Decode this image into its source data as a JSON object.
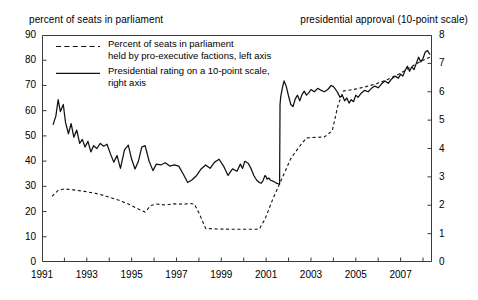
{
  "captions": {
    "left": "percent of seats in parliament",
    "right": "presidential approval (10-point scale)"
  },
  "legend": {
    "dashed": {
      "line1": "Percent of seats in parliament",
      "line2": "held by pro-executive factions, left axis",
      "swatch": "dashed-line-swatch"
    },
    "solid": {
      "line1": "Presidential rating on a 10-point scale,",
      "line2": "right axis",
      "swatch": "solid-line-swatch"
    }
  },
  "axes": {
    "left_ticks": [
      "90",
      "80",
      "70",
      "60",
      "50",
      "40",
      "30",
      "20",
      "10",
      "0"
    ],
    "right_ticks": [
      "8",
      "7",
      "6",
      "5",
      "4",
      "3",
      "2",
      "1",
      "0"
    ],
    "x_ticks": [
      "1991",
      "1993",
      "1995",
      "1997",
      "1999",
      "2001",
      "2003",
      "2005",
      "2007"
    ]
  },
  "chart_data": {
    "type": "line",
    "title": "",
    "xlabel": "",
    "ylabel": "percent of seats in parliament",
    "ylabel_right": "presidential approval (10-point scale)",
    "xlim": [
      1991,
      2008.4
    ],
    "ylim": [
      0,
      90
    ],
    "ylim_right": [
      0,
      8
    ],
    "grid": false,
    "legend_position": "upper-left-inside",
    "series": [
      {
        "name": "Percent of seats in parliament held by pro-executive factions, left axis",
        "style": "dashed",
        "axis": "left",
        "color": "#111111",
        "points": [
          [
            1991.45,
            26.0
          ],
          [
            1991.7,
            28.3
          ],
          [
            1992.0,
            29.0
          ],
          [
            1992.4,
            28.6
          ],
          [
            1992.9,
            28.0
          ],
          [
            1993.4,
            27.2
          ],
          [
            1993.9,
            26.0
          ],
          [
            1994.4,
            24.6
          ],
          [
            1994.9,
            22.8
          ],
          [
            1995.3,
            21.0
          ],
          [
            1995.6,
            19.8
          ],
          [
            1995.85,
            22.4
          ],
          [
            1996.1,
            23.0
          ],
          [
            1996.5,
            22.6
          ],
          [
            1996.9,
            23.1
          ],
          [
            1997.3,
            22.9
          ],
          [
            1997.6,
            23.2
          ],
          [
            1997.8,
            22.9
          ],
          [
            1998.0,
            19.5
          ],
          [
            1998.3,
            13.3
          ],
          [
            1998.8,
            13.1
          ],
          [
            1999.4,
            13.0
          ],
          [
            1999.9,
            13.0
          ],
          [
            2000.3,
            13.0
          ],
          [
            2000.55,
            13.0
          ],
          [
            2000.7,
            13.1
          ],
          [
            2000.95,
            17.0
          ],
          [
            2001.3,
            25.0
          ],
          [
            2001.7,
            33.0
          ],
          [
            2002.1,
            41.0
          ],
          [
            2002.5,
            46.0
          ],
          [
            2002.8,
            49.2
          ],
          [
            2003.2,
            49.4
          ],
          [
            2003.6,
            49.6
          ],
          [
            2003.95,
            52.0
          ],
          [
            2004.2,
            62.0
          ],
          [
            2004.45,
            67.8
          ],
          [
            2004.9,
            68.4
          ],
          [
            2005.4,
            69.4
          ],
          [
            2005.9,
            70.6
          ],
          [
            2006.4,
            72.3
          ],
          [
            2006.9,
            74.4
          ],
          [
            2007.4,
            77.0
          ],
          [
            2007.9,
            79.6
          ],
          [
            2008.3,
            81.2
          ]
        ]
      },
      {
        "name": "Presidential rating on a 10-point scale, right axis",
        "style": "solid",
        "axis": "right",
        "color": "#111111",
        "points": [
          [
            1991.5,
            4.85
          ],
          [
            1991.62,
            5.15
          ],
          [
            1991.72,
            5.72
          ],
          [
            1991.82,
            5.3
          ],
          [
            1991.95,
            5.55
          ],
          [
            1992.05,
            4.92
          ],
          [
            1992.18,
            4.52
          ],
          [
            1992.3,
            4.88
          ],
          [
            1992.42,
            4.4
          ],
          [
            1992.55,
            4.65
          ],
          [
            1992.68,
            4.18
          ],
          [
            1992.8,
            4.32
          ],
          [
            1992.92,
            4.05
          ],
          [
            1993.05,
            4.25
          ],
          [
            1993.18,
            3.88
          ],
          [
            1993.3,
            4.1
          ],
          [
            1993.45,
            4.0
          ],
          [
            1993.6,
            4.18
          ],
          [
            1993.75,
            4.08
          ],
          [
            1993.9,
            4.15
          ],
          [
            1994.05,
            3.82
          ],
          [
            1994.2,
            3.52
          ],
          [
            1994.35,
            3.75
          ],
          [
            1994.5,
            3.3
          ],
          [
            1994.68,
            3.95
          ],
          [
            1994.85,
            4.12
          ],
          [
            1995.0,
            3.62
          ],
          [
            1995.15,
            3.28
          ],
          [
            1995.3,
            3.55
          ],
          [
            1995.45,
            4.05
          ],
          [
            1995.6,
            4.1
          ],
          [
            1995.78,
            3.55
          ],
          [
            1995.95,
            3.22
          ],
          [
            1996.1,
            3.45
          ],
          [
            1996.3,
            3.42
          ],
          [
            1996.5,
            3.5
          ],
          [
            1996.7,
            3.38
          ],
          [
            1996.9,
            3.42
          ],
          [
            1997.1,
            3.38
          ],
          [
            1997.3,
            3.1
          ],
          [
            1997.5,
            2.8
          ],
          [
            1997.7,
            2.9
          ],
          [
            1997.9,
            3.05
          ],
          [
            1998.1,
            3.28
          ],
          [
            1998.3,
            3.42
          ],
          [
            1998.5,
            3.3
          ],
          [
            1998.7,
            3.52
          ],
          [
            1998.9,
            3.62
          ],
          [
            1999.1,
            3.38
          ],
          [
            1999.3,
            3.05
          ],
          [
            1999.5,
            3.28
          ],
          [
            1999.7,
            3.2
          ],
          [
            1999.85,
            3.45
          ],
          [
            1999.95,
            3.3
          ],
          [
            2000.05,
            3.55
          ],
          [
            2000.2,
            3.48
          ],
          [
            2000.32,
            3.3
          ],
          [
            2000.45,
            3.05
          ],
          [
            2000.58,
            2.88
          ],
          [
            2000.7,
            2.8
          ],
          [
            2000.78,
            2.78
          ],
          [
            2000.85,
            2.85
          ],
          [
            2000.95,
            3.05
          ],
          [
            2001.0,
            3.0
          ],
          [
            2001.05,
            2.92
          ],
          [
            2001.12,
            2.96
          ],
          [
            2001.2,
            2.88
          ],
          [
            2001.3,
            2.85
          ],
          [
            2001.38,
            2.82
          ],
          [
            2001.45,
            2.78
          ],
          [
            2001.52,
            2.76
          ],
          [
            2001.56,
            2.75
          ],
          [
            2001.6,
            2.74
          ],
          [
            2001.62,
            5.55
          ],
          [
            2001.65,
            5.82
          ],
          [
            2001.72,
            6.12
          ],
          [
            2001.8,
            6.38
          ],
          [
            2001.9,
            6.18
          ],
          [
            2002.0,
            5.85
          ],
          [
            2002.1,
            5.55
          ],
          [
            2002.2,
            5.48
          ],
          [
            2002.3,
            5.75
          ],
          [
            2002.4,
            5.88
          ],
          [
            2002.5,
            5.68
          ],
          [
            2002.6,
            5.9
          ],
          [
            2002.7,
            6.02
          ],
          [
            2002.8,
            5.88
          ],
          [
            2002.9,
            5.96
          ],
          [
            2003.0,
            6.08
          ],
          [
            2003.15,
            6.0
          ],
          [
            2003.3,
            6.12
          ],
          [
            2003.45,
            6.05
          ],
          [
            2003.6,
            6.0
          ],
          [
            2003.75,
            6.08
          ],
          [
            2003.9,
            6.22
          ],
          [
            2004.0,
            6.18
          ],
          [
            2004.1,
            6.08
          ],
          [
            2004.2,
            5.96
          ],
          [
            2004.3,
            5.8
          ],
          [
            2004.4,
            5.88
          ],
          [
            2004.5,
            5.68
          ],
          [
            2004.6,
            5.78
          ],
          [
            2004.7,
            5.6
          ],
          [
            2004.8,
            5.72
          ],
          [
            2004.9,
            5.65
          ],
          [
            2005.0,
            5.88
          ],
          [
            2005.1,
            5.8
          ],
          [
            2005.25,
            5.96
          ],
          [
            2005.4,
            6.05
          ],
          [
            2005.55,
            6.0
          ],
          [
            2005.7,
            6.12
          ],
          [
            2005.85,
            6.2
          ],
          [
            2006.0,
            6.14
          ],
          [
            2006.15,
            6.28
          ],
          [
            2006.3,
            6.38
          ],
          [
            2006.45,
            6.3
          ],
          [
            2006.6,
            6.45
          ],
          [
            2006.75,
            6.55
          ],
          [
            2006.9,
            6.48
          ],
          [
            2007.0,
            6.62
          ],
          [
            2007.1,
            6.55
          ],
          [
            2007.2,
            6.75
          ],
          [
            2007.3,
            6.9
          ],
          [
            2007.4,
            6.72
          ],
          [
            2007.5,
            6.88
          ],
          [
            2007.6,
            6.78
          ],
          [
            2007.7,
            7.0
          ],
          [
            2007.8,
            7.22
          ],
          [
            2007.9,
            7.05
          ],
          [
            2008.0,
            7.18
          ],
          [
            2008.1,
            7.4
          ],
          [
            2008.2,
            7.45
          ],
          [
            2008.3,
            7.32
          ]
        ]
      }
    ]
  }
}
